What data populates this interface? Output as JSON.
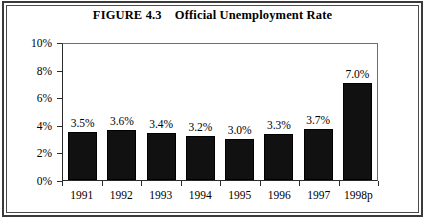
{
  "figure": {
    "title_label": "FIGURE 4.3",
    "title_text": "Official Unemployment Rate",
    "title_full": "FIGURE 4.3    Official Unemployment Rate"
  },
  "chart_data": {
    "type": "bar",
    "title": "FIGURE 4.3    Official Unemployment Rate",
    "xlabel": "",
    "ylabel": "",
    "categories": [
      "1991",
      "1992",
      "1993",
      "1994",
      "1995",
      "1996",
      "1997",
      "1998p"
    ],
    "values": [
      3.5,
      3.6,
      3.4,
      3.2,
      3.0,
      3.3,
      3.7,
      7.0
    ],
    "value_labels": [
      "3.5%",
      "3.6%",
      "3.4%",
      "3.2%",
      "3.0%",
      "3.3%",
      "3.7%",
      "7.0%"
    ],
    "ylim": [
      0,
      10
    ],
    "yticks": [
      0,
      2,
      4,
      6,
      8,
      10
    ],
    "ytick_labels": [
      "0%",
      "2%",
      "4%",
      "6%",
      "8%",
      "10%"
    ],
    "grid": false,
    "legend": null,
    "bar_color": "#111111",
    "series": [
      {
        "name": "Official Unemployment Rate",
        "values": [
          3.5,
          3.6,
          3.4,
          3.2,
          3.0,
          3.3,
          3.7,
          7.0
        ]
      }
    ]
  }
}
